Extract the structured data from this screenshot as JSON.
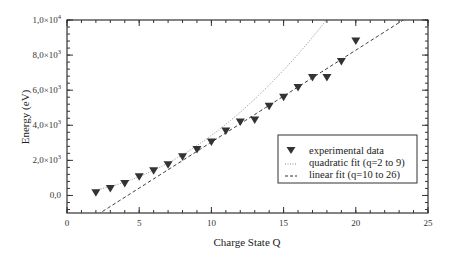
{
  "chart_data": {
    "type": "scatter",
    "title": "",
    "xlabel": "Charge State Q",
    "ylabel": "Energy (eV)",
    "xlim": [
      0,
      25
    ],
    "ylim": [
      -1000,
      10000
    ],
    "grid": false,
    "x_ticks": [
      0,
      5,
      10,
      15,
      20,
      25
    ],
    "x_tick_labels": [
      "0",
      "5",
      "10",
      "15",
      "20",
      "25"
    ],
    "x_minor_step": 1,
    "y_ticks": [
      0,
      2000,
      4000,
      6000,
      8000,
      10000
    ],
    "y_tick_labels": [
      {
        "mantissa": "0,0",
        "exp": ""
      },
      {
        "mantissa": "2,0×10",
        "exp": "3"
      },
      {
        "mantissa": "4,0×10",
        "exp": "3"
      },
      {
        "mantissa": "6,0×10",
        "exp": "3"
      },
      {
        "mantissa": "8,0×10",
        "exp": "3"
      },
      {
        "mantissa": "1,0×10",
        "exp": "4"
      }
    ],
    "y_minor_step": 400,
    "series": [
      {
        "name": "experimental data",
        "kind": "scatter",
        "marker": "triangle-down",
        "color": "#333333",
        "x": [
          2,
          3,
          4,
          5,
          6,
          7,
          8,
          9,
          10,
          11,
          12,
          13,
          14,
          15,
          16,
          17,
          18,
          19,
          20
        ],
        "y": [
          150,
          400,
          680,
          1070,
          1410,
          1750,
          2200,
          2620,
          3050,
          3670,
          4180,
          4300,
          5080,
          5600,
          6150,
          6720,
          6720,
          7630,
          8810
        ]
      },
      {
        "name": "quadratic fit (q=2 to 9)",
        "kind": "quadratic",
        "style": "dotted",
        "color": "#888888",
        "coefficients": {
          "a": 27.3,
          "b": 61.6,
          "c": 80
        },
        "x_range": [
          2,
          25
        ]
      },
      {
        "name": "linear fit (q=10 to 26)",
        "kind": "linear",
        "style": "dashed",
        "color": "#333333",
        "coefficients": {
          "slope": 524,
          "intercept": -2200
        },
        "x_range": [
          0,
          25
        ]
      }
    ],
    "legend": {
      "placement": "lower-right",
      "entries": [
        "experimental data",
        "quadratic fit (q=2 to 9)",
        "linear fit (q=10 to 26)"
      ]
    }
  }
}
